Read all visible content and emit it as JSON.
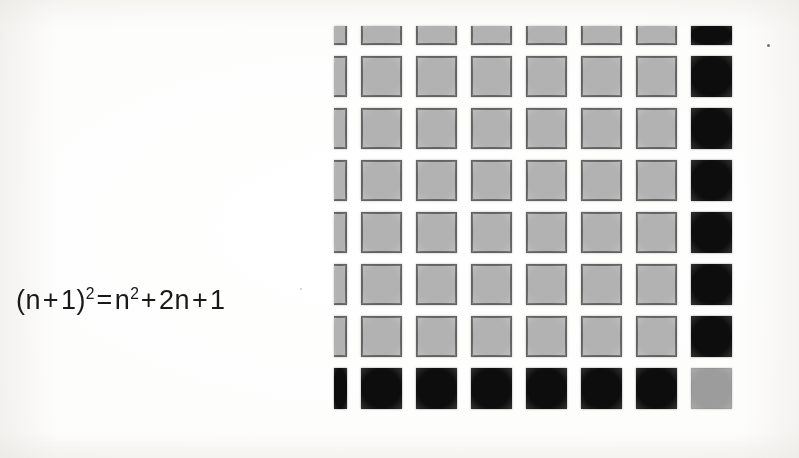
{
  "figure": {
    "kind": "geometric-algebra-diagram",
    "background_color": "#fdfdfc",
    "formula": {
      "full_text": "(n + 1)² = n² + 2n + 1",
      "lhs_open_paren": "(",
      "lhs_base": "n",
      "lhs_plus": "+",
      "lhs_one": "1",
      "lhs_close_paren": ")",
      "lhs_exponent": "2",
      "equals": "=",
      "rhs_n": "n",
      "rhs_n_exponent": "2",
      "rhs_plus_1": "+",
      "rhs_two_n": "2n",
      "rhs_plus_2": "+",
      "rhs_one": "1",
      "text_color": "#19191b"
    },
    "grid": {
      "rows": 8,
      "columns": 8,
      "cell_pitch_x": 55,
      "cell_pitch_y": 52,
      "square_size": 41,
      "top_row_clipped": true,
      "left_column_clipped": true,
      "colors": {
        "gray_fill": "#b2b2b2",
        "gray_border": "#636363",
        "black_fill": "#0d0d0d",
        "corner_gray_fill": "#9c9c9c"
      },
      "legend": {
        "gray_block_meaning": "n²",
        "black_block_meaning": "2n",
        "corner_block_meaning": "1"
      },
      "cells": [
        [
          "gray",
          "gray",
          "gray",
          "gray",
          "gray",
          "gray",
          "gray",
          "black"
        ],
        [
          "gray",
          "gray",
          "gray",
          "gray",
          "gray",
          "gray",
          "gray",
          "black"
        ],
        [
          "gray",
          "gray",
          "gray",
          "gray",
          "gray",
          "gray",
          "gray",
          "black"
        ],
        [
          "gray",
          "gray",
          "gray",
          "gray",
          "gray",
          "gray",
          "gray",
          "black"
        ],
        [
          "gray",
          "gray",
          "gray",
          "gray",
          "gray",
          "gray",
          "gray",
          "black"
        ],
        [
          "gray",
          "gray",
          "gray",
          "gray",
          "gray",
          "gray",
          "gray",
          "black"
        ],
        [
          "gray",
          "gray",
          "gray",
          "gray",
          "gray",
          "gray",
          "gray",
          "black"
        ],
        [
          "black",
          "black",
          "black",
          "black",
          "black",
          "black",
          "black",
          "corner"
        ]
      ]
    },
    "artifacts": {
      "speck_label": "scan-speck"
    }
  }
}
